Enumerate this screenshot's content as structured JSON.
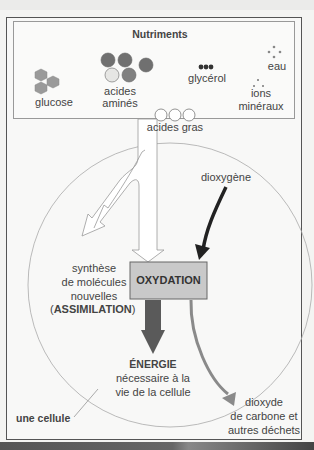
{
  "nutriments": {
    "title": "Nutriments",
    "items": [
      {
        "label": "glucose"
      },
      {
        "label_line1": "acides",
        "label_line2": "aminés"
      },
      {
        "label": "glycérol"
      },
      {
        "label": "eau"
      },
      {
        "label_line1": "ions",
        "label_line2": "minéraux"
      },
      {
        "label": "acides gras"
      }
    ]
  },
  "labels": {
    "dioxygene": "dioxygène",
    "synthese_1": "synthèse",
    "synthese_2": "de molécules",
    "synthese_3": "nouvelles",
    "synthese_4_open": "(",
    "synthese_4_bold": "ASSIMILATION",
    "synthese_4_close": ")",
    "oxydation": "OXYDATION",
    "energie_title": "ÉNERGIE",
    "energie_1": "nécessaire à la",
    "energie_2": "vie de la cellule",
    "dechets_1": "dioxyde",
    "dechets_2": "de carbone et",
    "dechets_3": "autres déchets",
    "cellule": "une cellule"
  },
  "colors": {
    "oxydation_box": "#c9c9c9",
    "energie_arrow": "#5a5a5a",
    "dechets_arrow": "#8a8a8a",
    "dioxygene_arrow": "#222222",
    "cell_outline": "#aaaaaa"
  }
}
